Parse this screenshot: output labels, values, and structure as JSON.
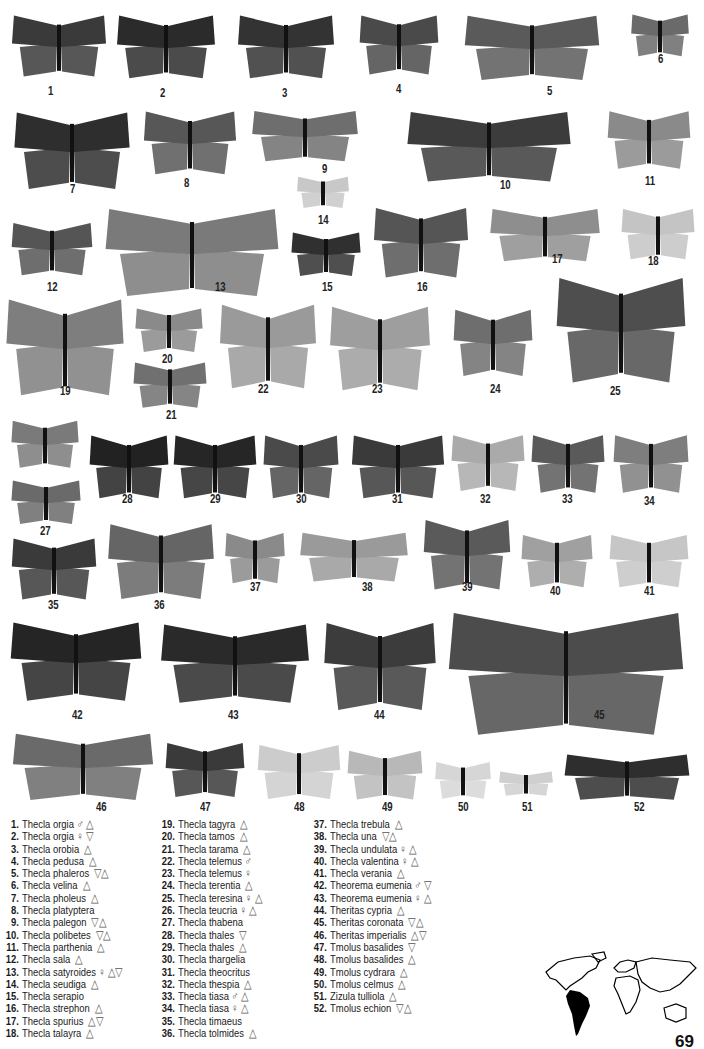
{
  "plate": {
    "specimens": [
      {
        "n": "1",
        "x": 10,
        "y": 12,
        "w": 98,
        "h": 70,
        "tone": "#3a3a3a",
        "lx": 48,
        "ly": 84
      },
      {
        "n": "2",
        "x": 115,
        "y": 12,
        "w": 102,
        "h": 72,
        "tone": "#2b2b2b",
        "lx": 160,
        "ly": 86
      },
      {
        "n": "3",
        "x": 236,
        "y": 12,
        "w": 100,
        "h": 72,
        "tone": "#333333",
        "lx": 282,
        "ly": 86
      },
      {
        "n": "4",
        "x": 358,
        "y": 12,
        "w": 82,
        "h": 68,
        "tone": "#4a4a4a",
        "lx": 396,
        "ly": 82
      },
      {
        "n": "5",
        "x": 462,
        "y": 12,
        "w": 140,
        "h": 74,
        "tone": "#5a5a5a",
        "lx": 547,
        "ly": 84
      },
      {
        "n": "6",
        "x": 630,
        "y": 12,
        "w": 60,
        "h": 48,
        "tone": "#6a6a6a",
        "lx": 658,
        "ly": 52
      },
      {
        "n": "7",
        "x": 12,
        "y": 108,
        "w": 120,
        "h": 88,
        "tone": "#2e2e2e",
        "lx": 70,
        "ly": 182
      },
      {
        "n": "8",
        "x": 142,
        "y": 108,
        "w": 96,
        "h": 72,
        "tone": "#575757",
        "lx": 184,
        "ly": 176
      },
      {
        "n": "9",
        "x": 250,
        "y": 108,
        "w": 110,
        "h": 58,
        "tone": "#6e6e6e",
        "lx": 322,
        "ly": 162
      },
      {
        "n": "10",
        "x": 404,
        "y": 108,
        "w": 170,
        "h": 80,
        "tone": "#3c3c3c",
        "lx": 500,
        "ly": 178
      },
      {
        "n": "11",
        "x": 606,
        "y": 108,
        "w": 86,
        "h": 66,
        "tone": "#8a8a8a",
        "lx": 645,
        "ly": 174
      },
      {
        "n": "14",
        "x": 296,
        "y": 175,
        "w": 54,
        "h": 36,
        "tone": "#c8c8c8",
        "lx": 318,
        "ly": 213
      },
      {
        "n": "12",
        "x": 10,
        "y": 220,
        "w": 84,
        "h": 60,
        "tone": "#555555",
        "lx": 47,
        "ly": 280
      },
      {
        "n": "13",
        "x": 102,
        "y": 204,
        "w": 180,
        "h": 100,
        "tone": "#7a7a7a",
        "lx": 215,
        "ly": 280
      },
      {
        "n": "15",
        "x": 290,
        "y": 230,
        "w": 72,
        "h": 50,
        "tone": "#303030",
        "lx": 322,
        "ly": 280
      },
      {
        "n": "16",
        "x": 372,
        "y": 204,
        "w": 98,
        "h": 80,
        "tone": "#555555",
        "lx": 417,
        "ly": 280
      },
      {
        "n": "17",
        "x": 488,
        "y": 206,
        "w": 114,
        "h": 60,
        "tone": "#8e8e8e",
        "lx": 552,
        "ly": 252
      },
      {
        "n": "18",
        "x": 620,
        "y": 206,
        "w": 76,
        "h": 58,
        "tone": "#c4c4c4",
        "lx": 648,
        "ly": 254
      },
      {
        "n": "19",
        "x": 4,
        "y": 294,
        "w": 122,
        "h": 110,
        "tone": "#7e7e7e",
        "lx": 60,
        "ly": 384
      },
      {
        "n": "20",
        "x": 134,
        "y": 306,
        "w": 70,
        "h": 50,
        "tone": "#8a8a8a",
        "lx": 162,
        "ly": 352
      },
      {
        "n": "21",
        "x": 132,
        "y": 360,
        "w": 76,
        "h": 52,
        "tone": "#707070",
        "lx": 166,
        "ly": 408
      },
      {
        "n": "22",
        "x": 218,
        "y": 300,
        "w": 100,
        "h": 96,
        "tone": "#9a9a9a",
        "lx": 258,
        "ly": 382
      },
      {
        "n": "23",
        "x": 328,
        "y": 302,
        "w": 104,
        "h": 96,
        "tone": "#9e9e9e",
        "lx": 372,
        "ly": 382
      },
      {
        "n": "24",
        "x": 452,
        "y": 306,
        "w": 82,
        "h": 76,
        "tone": "#6e6e6e",
        "lx": 490,
        "ly": 382
      },
      {
        "n": "25",
        "x": 554,
        "y": 272,
        "w": 134,
        "h": 120,
        "tone": "#4e4e4e",
        "lx": 610,
        "ly": 384
      },
      {
        "n": "26",
        "x": 10,
        "y": 418,
        "w": 70,
        "h": 54,
        "tone": "#7a7a7a",
        "lx": 40,
        "ly": 490
      },
      {
        "n": "27",
        "x": 10,
        "y": 478,
        "w": 72,
        "h": 50,
        "tone": "#6a6a6a",
        "lx": 40,
        "ly": 524
      },
      {
        "n": "28",
        "x": 88,
        "y": 432,
        "w": 82,
        "h": 72,
        "tone": "#222222",
        "lx": 122,
        "ly": 492
      },
      {
        "n": "29",
        "x": 172,
        "y": 432,
        "w": 86,
        "h": 72,
        "tone": "#262626",
        "lx": 210,
        "ly": 492
      },
      {
        "n": "30",
        "x": 262,
        "y": 432,
        "w": 78,
        "h": 72,
        "tone": "#4a4a4a",
        "lx": 296,
        "ly": 492
      },
      {
        "n": "31",
        "x": 350,
        "y": 432,
        "w": 96,
        "h": 72,
        "tone": "#3a3a3a",
        "lx": 392,
        "ly": 492
      },
      {
        "n": "32",
        "x": 450,
        "y": 432,
        "w": 76,
        "h": 64,
        "tone": "#aaaaaa",
        "lx": 480,
        "ly": 492
      },
      {
        "n": "33",
        "x": 530,
        "y": 432,
        "w": 76,
        "h": 66,
        "tone": "#5a5a5a",
        "lx": 562,
        "ly": 492
      },
      {
        "n": "34",
        "x": 612,
        "y": 432,
        "w": 78,
        "h": 66,
        "tone": "#7e7e7e",
        "lx": 644,
        "ly": 494
      },
      {
        "n": "35",
        "x": 10,
        "y": 535,
        "w": 88,
        "h": 70,
        "tone": "#3a3a3a",
        "lx": 48,
        "ly": 598
      },
      {
        "n": "36",
        "x": 106,
        "y": 520,
        "w": 110,
        "h": 86,
        "tone": "#656565",
        "lx": 154,
        "ly": 598
      },
      {
        "n": "37",
        "x": 224,
        "y": 530,
        "w": 62,
        "h": 58,
        "tone": "#8a8a8a",
        "lx": 250,
        "ly": 580
      },
      {
        "n": "38",
        "x": 298,
        "y": 530,
        "w": 112,
        "h": 56,
        "tone": "#9a9a9a",
        "lx": 362,
        "ly": 580
      },
      {
        "n": "39",
        "x": 422,
        "y": 516,
        "w": 90,
        "h": 80,
        "tone": "#5a5a5a",
        "lx": 462,
        "ly": 580
      },
      {
        "n": "40",
        "x": 520,
        "y": 532,
        "w": 74,
        "h": 60,
        "tone": "#a0a0a0",
        "lx": 550,
        "ly": 584
      },
      {
        "n": "41",
        "x": 608,
        "y": 532,
        "w": 82,
        "h": 60,
        "tone": "#c6c6c6",
        "lx": 644,
        "ly": 584
      },
      {
        "n": "42",
        "x": 8,
        "y": 618,
        "w": 136,
        "h": 90,
        "tone": "#252525",
        "lx": 72,
        "ly": 708
      },
      {
        "n": "43",
        "x": 158,
        "y": 620,
        "w": 154,
        "h": 90,
        "tone": "#2a2a2a",
        "lx": 228,
        "ly": 708
      },
      {
        "n": "44",
        "x": 322,
        "y": 618,
        "w": 116,
        "h": 100,
        "tone": "#3c3c3c",
        "lx": 374,
        "ly": 708
      },
      {
        "n": "45",
        "x": 444,
        "y": 606,
        "w": 244,
        "h": 140,
        "tone": "#4c4c4c",
        "lx": 594,
        "ly": 708
      },
      {
        "n": "46",
        "x": 10,
        "y": 730,
        "w": 146,
        "h": 76,
        "tone": "#6a6a6a",
        "lx": 96,
        "ly": 800
      },
      {
        "n": "47",
        "x": 164,
        "y": 740,
        "w": 82,
        "h": 62,
        "tone": "#3a3a3a",
        "lx": 200,
        "ly": 800
      },
      {
        "n": "48",
        "x": 256,
        "y": 742,
        "w": 86,
        "h": 62,
        "tone": "#cccccc",
        "lx": 294,
        "ly": 800
      },
      {
        "n": "49",
        "x": 346,
        "y": 748,
        "w": 78,
        "h": 56,
        "tone": "#b8b8b8",
        "lx": 382,
        "ly": 800
      },
      {
        "n": "50",
        "x": 434,
        "y": 760,
        "w": 58,
        "h": 42,
        "tone": "#d6d6d6",
        "lx": 458,
        "ly": 800
      },
      {
        "n": "51",
        "x": 498,
        "y": 770,
        "w": 56,
        "h": 28,
        "tone": "#cfcfcf",
        "lx": 522,
        "ly": 800
      },
      {
        "n": "52",
        "x": 562,
        "y": 752,
        "w": 130,
        "h": 52,
        "tone": "#2e2e2e",
        "lx": 634,
        "ly": 800
      }
    ]
  },
  "legend": {
    "columns": [
      [
        {
          "n": "1.",
          "name": "Thecla orgia",
          "sex": "♂",
          "sym": "△"
        },
        {
          "n": "2.",
          "name": "Thecla orgia",
          "sex": "♀",
          "sym": "▽"
        },
        {
          "n": "3.",
          "name": "Thecla orobia",
          "sex": "",
          "sym": "△"
        },
        {
          "n": "4.",
          "name": "Thecla pedusa",
          "sex": "",
          "sym": "△"
        },
        {
          "n": "5.",
          "name": "Thecla phaleros",
          "sex": "",
          "sym": "▽△"
        },
        {
          "n": "6.",
          "name": "Thecla velina",
          "sex": "",
          "sym": "△"
        },
        {
          "n": "7.",
          "name": "Thecla pholeus",
          "sex": "",
          "sym": "△"
        },
        {
          "n": "8.",
          "name": "Thecla platyptera",
          "sex": "",
          "sym": ""
        },
        {
          "n": "9.",
          "name": "Thecla palegon",
          "sex": "",
          "sym": "▽△"
        },
        {
          "n": "10.",
          "name": "Thecla polibetes",
          "sex": "",
          "sym": "▽△"
        },
        {
          "n": "11.",
          "name": "Thecla parthenia",
          "sex": "",
          "sym": "△"
        },
        {
          "n": "12.",
          "name": "Thecla sala",
          "sex": "",
          "sym": "△"
        },
        {
          "n": "13.",
          "name": "Thecla satyroides",
          "sex": "♀",
          "sym": "△▽"
        },
        {
          "n": "14.",
          "name": "Thecla seudiga",
          "sex": "",
          "sym": "△"
        },
        {
          "n": "15.",
          "name": "Thecla serapio",
          "sex": "",
          "sym": ""
        },
        {
          "n": "16.",
          "name": "Thecla strephon",
          "sex": "",
          "sym": "△"
        },
        {
          "n": "17.",
          "name": "Thecla spurius",
          "sex": "",
          "sym": "△▽"
        },
        {
          "n": "18.",
          "name": "Thecla talayra",
          "sex": "",
          "sym": "△"
        }
      ],
      [
        {
          "n": "19.",
          "name": "Thecla tagyra",
          "sex": "",
          "sym": "△"
        },
        {
          "n": "20.",
          "name": "Thecla tamos",
          "sex": "",
          "sym": "△"
        },
        {
          "n": "21.",
          "name": "Thecla tarama",
          "sex": "",
          "sym": "△"
        },
        {
          "n": "22.",
          "name": "Thecla telemus",
          "sex": "♂",
          "sym": ""
        },
        {
          "n": "23.",
          "name": "Thecla telemus",
          "sex": "♀",
          "sym": ""
        },
        {
          "n": "24.",
          "name": "Thecla terentia",
          "sex": "",
          "sym": "△"
        },
        {
          "n": "25.",
          "name": "Thecla teresina",
          "sex": "♀",
          "sym": "△"
        },
        {
          "n": "26.",
          "name": "Thecla teucria",
          "sex": "♀",
          "sym": "△"
        },
        {
          "n": "27.",
          "name": "Thecla thabena",
          "sex": "",
          "sym": ""
        },
        {
          "n": "28.",
          "name": "Thecla thales",
          "sex": "",
          "sym": "▽"
        },
        {
          "n": "29.",
          "name": "Thecla thales",
          "sex": "",
          "sym": "△"
        },
        {
          "n": "30.",
          "name": "Thecla thargelia",
          "sex": "",
          "sym": ""
        },
        {
          "n": "31.",
          "name": "Thecla theocritus",
          "sex": "",
          "sym": ""
        },
        {
          "n": "32.",
          "name": "Thecla thespia",
          "sex": "",
          "sym": "△"
        },
        {
          "n": "33.",
          "name": "Thecla tiasa",
          "sex": "♂",
          "sym": "△"
        },
        {
          "n": "34.",
          "name": "Thecla tiasa",
          "sex": "♀",
          "sym": "△"
        },
        {
          "n": "35.",
          "name": "Thecla timaeus",
          "sex": "",
          "sym": ""
        },
        {
          "n": "36.",
          "name": "Thecla tolmides",
          "sex": "",
          "sym": "△"
        }
      ],
      [
        {
          "n": "37.",
          "name": "Thecla trebula",
          "sex": "",
          "sym": "△"
        },
        {
          "n": "38.",
          "name": "Thecla una",
          "sex": "",
          "sym": "▽△"
        },
        {
          "n": "39.",
          "name": "Thecla undulata",
          "sex": "♀",
          "sym": "△"
        },
        {
          "n": "40.",
          "name": "Thecla valentina",
          "sex": "♀",
          "sym": "△"
        },
        {
          "n": "41.",
          "name": "Thecla verania",
          "sex": "",
          "sym": "△"
        },
        {
          "n": "42.",
          "name": "Theorema eumenia",
          "sex": "♂",
          "sym": "▽"
        },
        {
          "n": "43.",
          "name": "Theorema eumenia",
          "sex": "♀",
          "sym": "△"
        },
        {
          "n": "44.",
          "name": "Theritas cypria",
          "sex": "",
          "sym": "△"
        },
        {
          "n": "45.",
          "name": "Theritas coronata",
          "sex": "",
          "sym": "▽△"
        },
        {
          "n": "46.",
          "name": "Theritas imperialis",
          "sex": "",
          "sym": "△▽"
        },
        {
          "n": "47.",
          "name": "Tmolus basalides",
          "sex": "",
          "sym": "▽"
        },
        {
          "n": "48.",
          "name": "Tmolus basalides",
          "sex": "",
          "sym": "△"
        },
        {
          "n": "49.",
          "name": "Tmolus cydrara",
          "sex": "",
          "sym": "△"
        },
        {
          "n": "50.",
          "name": "Tmolus celmus",
          "sex": "",
          "sym": "△"
        },
        {
          "n": "51.",
          "name": "Zizula tulliola",
          "sex": "",
          "sym": "△"
        },
        {
          "n": "52.",
          "name": "Tmolus echion",
          "sex": "",
          "sym": "▽△"
        }
      ]
    ]
  },
  "map": {
    "highlight_region": "South America",
    "highlight_color": "#000000"
  },
  "page_number": "69"
}
